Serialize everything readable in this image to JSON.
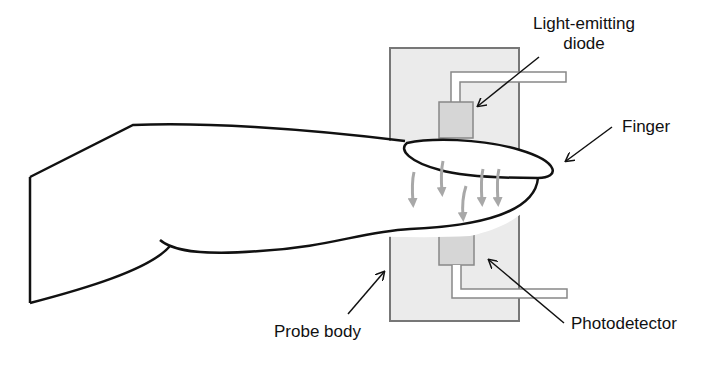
{
  "diagram": {
    "labels": {
      "led": {
        "line1": "Light-emitting",
        "line2": "diode"
      },
      "finger": "Finger",
      "probe_body": "Probe body",
      "photodetector": "Photodetector"
    },
    "colors": {
      "outline": "#111111",
      "probe_fill": "#ebebeb",
      "probe_stroke": "#777777",
      "component_fill": "#d6d6d6",
      "light_arrows": "#a8a8a8",
      "background": "#ffffff"
    },
    "light_arrow_count": 6
  }
}
